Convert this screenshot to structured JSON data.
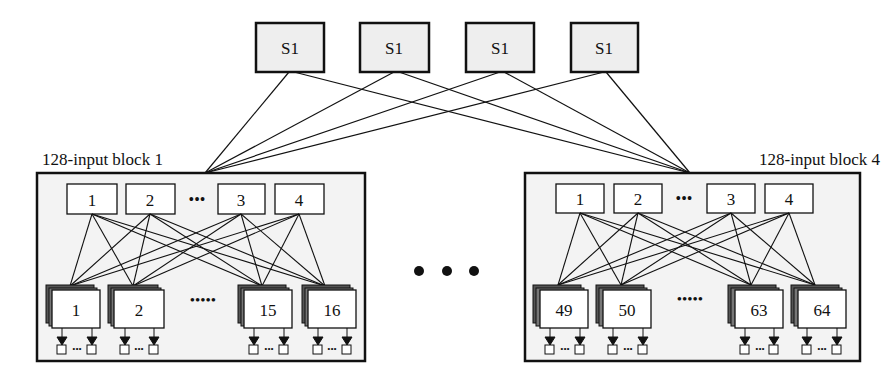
{
  "diagram": {
    "top_switches": [
      {
        "label": "S1"
      },
      {
        "label": "S1"
      },
      {
        "label": "S1"
      },
      {
        "label": "S1"
      }
    ],
    "blocks": [
      {
        "title": "128-input block 1",
        "top_nodes": [
          "1",
          "2",
          "3",
          "4"
        ],
        "bottom_nodes": [
          "1",
          "2",
          "15",
          "16"
        ]
      },
      {
        "title": "128-input block 4",
        "top_nodes": [
          "1",
          "2",
          "3",
          "4"
        ],
        "bottom_nodes": [
          "49",
          "50",
          "63",
          "64"
        ]
      }
    ],
    "ellipsis": "•••",
    "colors": {
      "switch_fill": "#eeeeee",
      "block_fill": "#f3f3f3",
      "node_fill": "#ffffff",
      "stroke": "#111111",
      "stack_shadow": "#555555"
    }
  }
}
